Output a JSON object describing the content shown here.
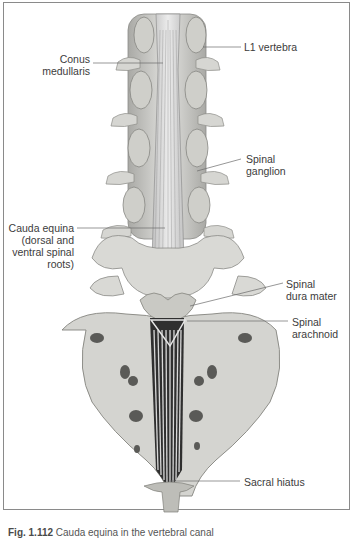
{
  "figure": {
    "labels": {
      "conus_medullaris": [
        "Conus",
        "medullaris"
      ],
      "l1_vertebra": "L1 vertebra",
      "spinal_ganglion": [
        "Spinal",
        "ganglion"
      ],
      "cauda_equina": [
        "Cauda equina",
        "(dorsal and",
        "ventral spinal",
        "roots)"
      ],
      "spinal_dura_mater": [
        "Spinal",
        "dura mater"
      ],
      "spinal_arachnoid": [
        "Spinal",
        "arachnoid"
      ],
      "sacral_hiatus": "Sacral hiatus"
    },
    "caption": {
      "number": "Fig. 1.112",
      "text": "Cauda equina in the vertebral canal"
    }
  },
  "colors": {
    "bone": "#d9d9d6",
    "bone_shadow": "#9a9a96",
    "nerve": "#cfcfcf",
    "leader_line": "#6a6a6a",
    "frame": "#8a8a8a"
  }
}
